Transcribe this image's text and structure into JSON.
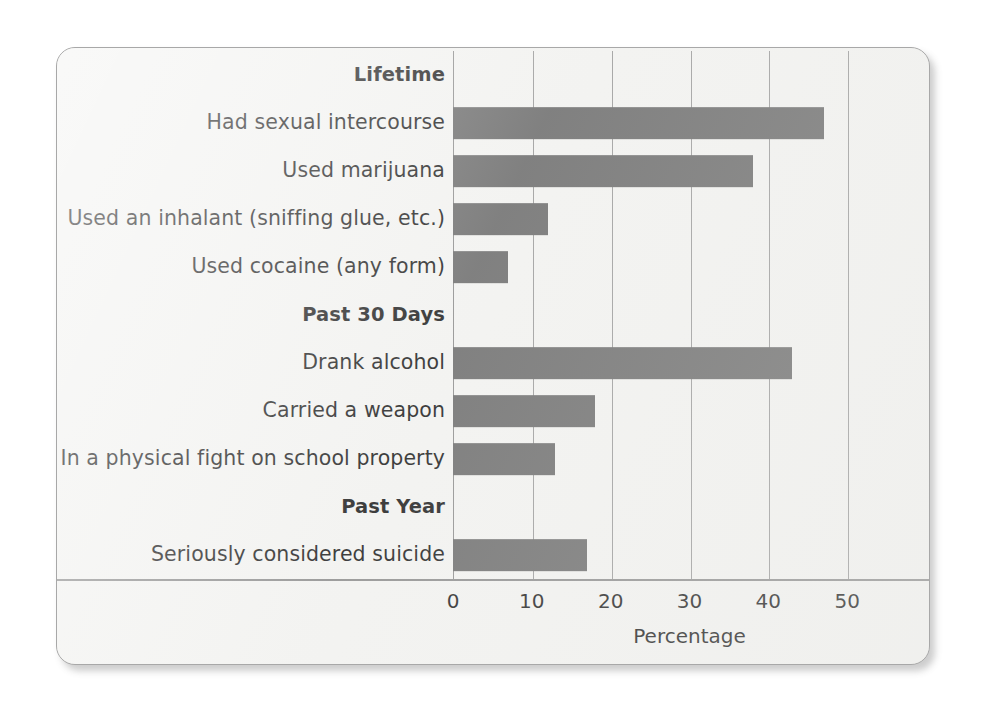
{
  "chart_data": {
    "type": "bar",
    "orientation": "horizontal",
    "title": "",
    "xlabel": "Percentage",
    "ylabel": "",
    "xlim": [
      0,
      60
    ],
    "xticks": [
      0,
      10,
      20,
      30,
      40,
      50
    ],
    "xtick_labels": [
      "0",
      "10",
      "20",
      "30",
      "40",
      "50"
    ],
    "grid": "vertical",
    "legend": "none",
    "bar_color": "#6b6b6b",
    "groups": [
      {
        "label": "Lifetime",
        "items": [
          {
            "label": "Had sexual intercourse",
            "value": 47
          },
          {
            "label": "Used marijuana",
            "value": 38
          },
          {
            "label": "Used an inhalant (sniffing glue, etc.)",
            "value": 12
          },
          {
            "label": "Used cocaine (any form)",
            "value": 7
          }
        ]
      },
      {
        "label": "Past 30 Days",
        "items": [
          {
            "label": "Drank alcohol",
            "value": 43
          },
          {
            "label": "Carried a weapon",
            "value": 18
          },
          {
            "label": "In a physical fight on school property",
            "value": 13
          }
        ]
      },
      {
        "label": "Past Year",
        "items": [
          {
            "label": "Seriously considered suicide",
            "value": 17
          }
        ]
      }
    ],
    "categories": [
      "Had sexual intercourse",
      "Used marijuana",
      "Used an inhalant (sniffing glue, etc.)",
      "Used cocaine (any form)",
      "Drank alcohol",
      "Carried a weapon",
      "In a physical fight on school property",
      "Seriously considered suicide"
    ],
    "values": [
      47,
      38,
      12,
      7,
      43,
      18,
      13,
      17
    ]
  },
  "axis": {
    "title": "Percentage"
  }
}
